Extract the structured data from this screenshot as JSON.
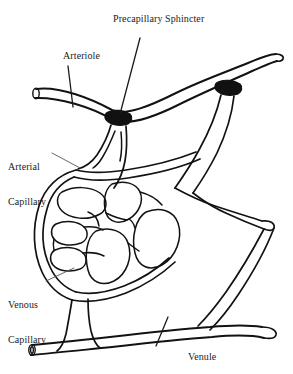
{
  "figure": {
    "background_color": "#ffffff",
    "ink_color": "#121212",
    "width": 293,
    "height": 374
  },
  "labels": {
    "precapillary_sphincter": "Precapillary Sphincter",
    "arteriole": "Arteriole",
    "arterial_capillary_line1": "Arterial",
    "arterial_capillary_line2": "Capillary",
    "venous_capillary_line1": "Venous",
    "venous_capillary_line2": "Capillary",
    "venule": "Venule"
  },
  "structures": {
    "arteriole": "arteriole-vessel",
    "venule": "venule-vessel",
    "sphincter_1": "precapillary-sphincter-left",
    "sphincter_2": "precapillary-sphincter-right",
    "capillary_bed": "capillary-bed-network",
    "arteriole_open_end": "arteriole-cut-end",
    "venule_open_end": "venule-cut-end"
  },
  "colors": {
    "ink": "#121212",
    "sphincter_fill": "#111111",
    "leader": "#1a1a1a",
    "background": "#ffffff"
  }
}
